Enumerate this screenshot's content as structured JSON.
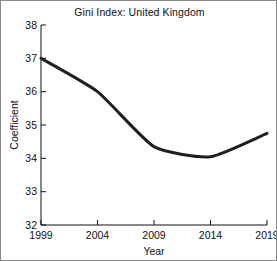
{
  "chart_data": {
    "type": "line",
    "title": "Gini Index: United Kingdom",
    "xlabel": "Year",
    "ylabel": "Coefficient",
    "x": [
      1999,
      2004,
      2009,
      2014,
      2019
    ],
    "values": [
      37.0,
      36.0,
      34.35,
      34.05,
      34.75
    ],
    "series": [
      {
        "name": "Gini coefficient",
        "values": [
          37.0,
          36.0,
          34.35,
          34.05,
          34.75
        ]
      }
    ],
    "xticks": [
      "1999",
      "2004",
      "2009",
      "2014",
      "2019"
    ],
    "yticks": [
      "32",
      "33",
      "34",
      "35",
      "36",
      "37",
      "38"
    ],
    "xlim": [
      1999,
      2019
    ],
    "ylim": [
      32,
      38
    ],
    "grid": false,
    "legend": false,
    "line_color": "#1f1f1f",
    "line_width": 3,
    "background_color": "#ffffff",
    "frame_color": "#8a8a8a"
  }
}
